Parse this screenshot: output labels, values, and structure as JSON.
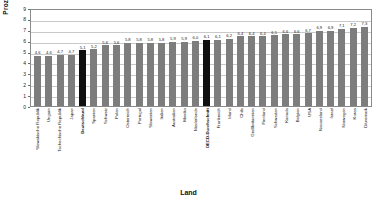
{
  "chart_data": {
    "type": "bar",
    "title": "",
    "xlabel": "Land",
    "ylabel": "Prozent",
    "ylim": [
      0,
      9
    ],
    "yticks": [
      "9",
      "8",
      "7",
      "6",
      "5",
      "4",
      "3",
      "2",
      "1",
      "0"
    ],
    "grid": true,
    "legend": "none",
    "highlight_color": "#101010",
    "bar_color": "#7d7d7d",
    "highlighted": [
      "Deutschland",
      "OECD-Durchschnitt"
    ],
    "categories": [
      "Slowakische Republik",
      "Ungarn",
      "Tschechische Republik",
      "Japan",
      "Deutschland",
      "Spanien",
      "Schweiz",
      "Polen",
      "Österreich",
      "Portugal",
      "Slowenien",
      "Italien",
      "Australien",
      "Mexiko",
      "Niederlande",
      "OECD-Durchschnitt",
      "Frankreich",
      "Irland",
      "Chile",
      "Großbritannien",
      "Finnland",
      "Schweden",
      "Kanada",
      "Belgien",
      "USA",
      "Neuseeland",
      "Israel",
      "Norwegen",
      "Korea",
      "Dänemark"
    ],
    "values": [
      4.6,
      4.6,
      4.7,
      4.7,
      5.1,
      5.2,
      5.6,
      5.6,
      5.8,
      5.8,
      5.8,
      5.8,
      5.9,
      5.9,
      6.0,
      6.1,
      6.1,
      6.2,
      6.4,
      6.4,
      6.4,
      6.5,
      6.6,
      6.6,
      6.7,
      6.9,
      6.9,
      7.1,
      7.2,
      7.3
    ],
    "value_labels": [
      "4,6",
      "4,6",
      "4,7",
      "4,7",
      "5,1",
      "5,2",
      "5,6",
      "5,6",
      "5,8",
      "5,8",
      "5,8",
      "5,8",
      "5,9",
      "5,9",
      "6,0",
      "6,1",
      "6,1",
      "6,2",
      "6,4",
      "6,4",
      "6,4",
      "6,5",
      "6,6",
      "6,6",
      "6,7",
      "6,9",
      "6,9",
      "7,1",
      "7,2",
      "7,3"
    ]
  }
}
